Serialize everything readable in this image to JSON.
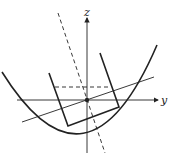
{
  "diagram": {
    "title": "",
    "axes": {
      "z_label": "z",
      "y_label": "y"
    },
    "elements": [
      "parabola",
      "rotated-rectangle",
      "tilted-line",
      "dashed-rotated-axis",
      "dashed-horizontal-line",
      "origin-point"
    ],
    "colors": {
      "stroke": "#222222",
      "background": "#ffffff"
    }
  }
}
